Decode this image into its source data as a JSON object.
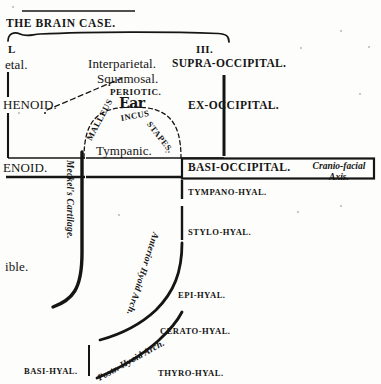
{
  "page": {
    "running_head": "THE BRAIN CASE.",
    "width": 381,
    "height": 384,
    "ink_color": "#151515",
    "paper_color": "#fdfdfb"
  },
  "column_heads": {
    "left_cut": "L",
    "right": "III."
  },
  "left_margin_cut_words": {
    "parietal": "etal.",
    "sphenoid_upper": "HENOID.",
    "sphenoid_lower": "ENOID.",
    "mandible": "ible."
  },
  "cranial_roof": {
    "interparietal": "Interparietal.",
    "squamosal": "Squamosal.",
    "periotic": "PERIOTIC.",
    "ear": "Ear"
  },
  "occipital_column": {
    "supra_occipital": "SUPRA-OCCIPITAL.",
    "ex_occipital": "EX-OCCIPITAL.",
    "basi_occipital": "BASI-OCCIPITAL."
  },
  "ossicles": {
    "arc_label": "MALLEUS—INCUS—STAPES.",
    "segments": [
      "MALLEUS",
      "INCUS",
      "STAPES."
    ]
  },
  "tympanic": "Tympanic.",
  "meckels_cartilage": "Meckel's Cartilage.",
  "axis_note": {
    "line1": "Cranio-facial",
    "line2": "Axis."
  },
  "hyoid_arches": {
    "anterior_label": "Anterior Hyoid Arch.",
    "posterior_label": "Postr. Hyoid Arch.",
    "segments": [
      {
        "name": "TYMPANO-HYAL."
      },
      {
        "name": "STYLO-HYAL."
      },
      {
        "name": "EPI-HYAL."
      },
      {
        "name": "CERATO-HYAL."
      },
      {
        "name": "THYRO-HYAL."
      },
      {
        "name": "BASI-HYAL."
      }
    ]
  }
}
